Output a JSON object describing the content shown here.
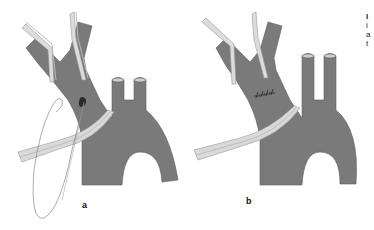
{
  "figure": {
    "panels": [
      {
        "id": "a",
        "label": "a",
        "suture": "interrupted suture with loose thread"
      },
      {
        "id": "b",
        "label": "b",
        "suture": "completed row of sutures"
      }
    ],
    "colors": {
      "vessel": "#7a7a7a",
      "vessel_dark": "#5f5f5f",
      "instrument": "#d9d9d9",
      "instrument_edge": "#9a9a9a",
      "suture": "#888888",
      "background": "#ffffff"
    },
    "edge_text_fragments": [
      "I",
      "i",
      "a",
      "t"
    ]
  }
}
